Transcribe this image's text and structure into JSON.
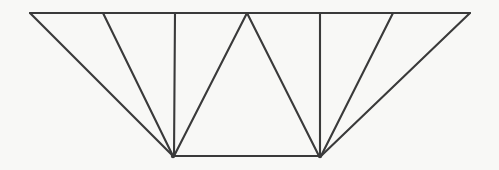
{
  "figure": {
    "kind": "line-drawing",
    "width": 499,
    "height": 170,
    "background_color": "#f8f8f6",
    "line_color": "#3a3a3a",
    "line_width": 2.1,
    "top_chord_label": "top chord",
    "bottom_chord_label": "bottom chord"
  },
  "geometry": {
    "nodes": {
      "top_left_end": {
        "name": "T0",
        "x": 30,
        "y": 13
      },
      "top_1": {
        "name": "T1",
        "x": 103,
        "y": 13
      },
      "top_2": {
        "name": "T2",
        "x": 175,
        "y": 13
      },
      "top_center": {
        "name": "T3",
        "x": 247,
        "y": 13
      },
      "top_4": {
        "name": "T4",
        "x": 320,
        "y": 13
      },
      "top_5": {
        "name": "T5",
        "x": 393,
        "y": 13
      },
      "top_right_end": {
        "name": "T6",
        "x": 470,
        "y": 13
      },
      "bottom_left": {
        "name": "B0",
        "x": 173,
        "y": 156
      },
      "bottom_right": {
        "name": "B1",
        "x": 320,
        "y": 156
      }
    },
    "members": [
      {
        "id": "m-top-chord",
        "label": "top chord",
        "from": "T0",
        "to": "T6",
        "x1": 30,
        "y1": 13,
        "x2": 470,
        "y2": 13
      },
      {
        "id": "m-bottom-chord",
        "label": "bottom chord",
        "from": "B0",
        "to": "B1",
        "x1": 173,
        "y1": 156,
        "x2": 320,
        "y2": 156
      },
      {
        "id": "m-left-end-post",
        "label": "left end diagonal",
        "from": "T0",
        "to": "B0",
        "x1": 30,
        "y1": 13,
        "x2": 173,
        "y2": 156
      },
      {
        "id": "m-left-diag-1",
        "label": "left fan diagonal 1",
        "from": "T1",
        "to": "B0",
        "x1": 103,
        "y1": 13,
        "x2": 173,
        "y2": 156
      },
      {
        "id": "m-left-vertical",
        "label": "left vertical post",
        "from": "T2",
        "to": "B0",
        "x1": 175,
        "y1": 13,
        "x2": 174,
        "y2": 156
      },
      {
        "id": "m-left-diag-2",
        "label": "left center diagonal",
        "from": "T3",
        "to": "B0",
        "x1": 247,
        "y1": 13,
        "x2": 174,
        "y2": 156
      },
      {
        "id": "m-right-diag-2",
        "label": "right center diagonal",
        "from": "T3",
        "to": "B1",
        "x1": 247,
        "y1": 13,
        "x2": 319,
        "y2": 156
      },
      {
        "id": "m-right-vertical",
        "label": "right vertical post",
        "from": "T4",
        "to": "B1",
        "x1": 320,
        "y1": 13,
        "x2": 320,
        "y2": 156
      },
      {
        "id": "m-right-diag-1",
        "label": "right fan diagonal 1",
        "from": "T5",
        "to": "B1",
        "x1": 393,
        "y1": 13,
        "x2": 321,
        "y2": 156
      },
      {
        "id": "m-right-end-post",
        "label": "right end diagonal",
        "from": "T6",
        "to": "B1",
        "x1": 470,
        "y1": 13,
        "x2": 321,
        "y2": 156
      }
    ]
  },
  "chart_data": {
    "type": "line",
    "xlabel": "",
    "ylabel": "",
    "xlim": [
      0,
      499
    ],
    "ylim": [
      170,
      0
    ],
    "grid": false,
    "legend": "none",
    "series": [
      {
        "name": "top chord",
        "x": [
          30,
          470
        ],
        "y": [
          13,
          13
        ]
      },
      {
        "name": "bottom chord",
        "x": [
          173,
          320
        ],
        "y": [
          156,
          156
        ]
      },
      {
        "name": "left end diagonal",
        "x": [
          30,
          173
        ],
        "y": [
          13,
          156
        ]
      },
      {
        "name": "left fan diagonal 1",
        "x": [
          103,
          173
        ],
        "y": [
          13,
          156
        ]
      },
      {
        "name": "left vertical post",
        "x": [
          175,
          174
        ],
        "y": [
          13,
          156
        ]
      },
      {
        "name": "left center diagonal",
        "x": [
          247,
          174
        ],
        "y": [
          13,
          156
        ]
      },
      {
        "name": "right center diagonal",
        "x": [
          247,
          319
        ],
        "y": [
          13,
          156
        ]
      },
      {
        "name": "right vertical post",
        "x": [
          320,
          320
        ],
        "y": [
          13,
          156
        ]
      },
      {
        "name": "right fan diagonal 1",
        "x": [
          393,
          321
        ],
        "y": [
          13,
          156
        ]
      },
      {
        "name": "right end diagonal",
        "x": [
          470,
          321
        ],
        "y": [
          13,
          156
        ]
      }
    ],
    "annotations": []
  }
}
